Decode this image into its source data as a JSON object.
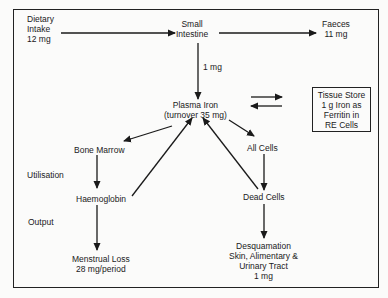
{
  "diagram": {
    "nodes": {
      "dietary_intake": "Dietary\nIntake\n12 mg",
      "small_intestine": "Small\nIntestine",
      "faeces": "Faeces\n11 mg",
      "absorption": "1 mg",
      "plasma_iron": "Plasma Iron\n(turnover 35 mg)",
      "tissue_store": "Tissue Store\n1 g Iron as\nFerritin in\nRE Cells",
      "bone_marrow": "Bone Marrow",
      "all_cells": "All Cells",
      "haemoglobin": "Haemoglobin",
      "dead_cells": "Dead Cells",
      "menstrual_loss": "Menstrual Loss\n28 mg/period",
      "desquamation": "Desquamation\nSkin, Alimentary &\nUrinary Tract\n1 mg"
    },
    "side_labels": {
      "utilisation": "Utilisation",
      "output": "Output"
    },
    "edges": [
      {
        "from": "dietary_intake",
        "to": "small_intestine"
      },
      {
        "from": "small_intestine",
        "to": "faeces"
      },
      {
        "from": "small_intestine",
        "to": "plasma_iron",
        "label": "1 mg"
      },
      {
        "from": "plasma_iron",
        "to": "tissue_store"
      },
      {
        "from": "tissue_store",
        "to": "plasma_iron"
      },
      {
        "from": "plasma_iron",
        "to": "bone_marrow"
      },
      {
        "from": "plasma_iron",
        "to": "all_cells"
      },
      {
        "from": "bone_marrow",
        "to": "haemoglobin"
      },
      {
        "from": "haemoglobin",
        "to": "plasma_iron"
      },
      {
        "from": "all_cells",
        "to": "dead_cells"
      },
      {
        "from": "dead_cells",
        "to": "plasma_iron"
      },
      {
        "from": "haemoglobin",
        "to": "menstrual_loss"
      },
      {
        "from": "dead_cells",
        "to": "desquamation"
      }
    ],
    "colors": {
      "ink": "#1a1a1a",
      "background": "#fbfbfa"
    }
  }
}
